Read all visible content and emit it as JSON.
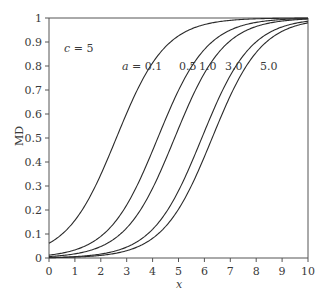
{
  "chart_data": {
    "type": "line",
    "title": "",
    "xlabel": "x",
    "ylabel": "MD",
    "xlim": [
      0,
      10
    ],
    "ylim": [
      0,
      1
    ],
    "grid": false,
    "legend": "none (inline curve labels)",
    "x_ticks": [
      "0",
      "1",
      "2",
      "3",
      "4",
      "5",
      "6",
      "7",
      "8",
      "9",
      "10"
    ],
    "y_ticks": [
      "0",
      "0.1",
      "0.2",
      "0.3",
      "0.4",
      "0.5",
      "0.6",
      "0.7",
      "0.8",
      "0.9",
      "1"
    ],
    "annotations": [
      {
        "text": "c = 5",
        "x": 0.55,
        "y": 0.9
      },
      {
        "text": "a = 0.1",
        "x": 2.85,
        "y": 0.8
      },
      {
        "text": "0.5",
        "x": 4.85,
        "y": 0.8
      },
      {
        "text": "1.0",
        "x": 5.5,
        "y": 0.8
      },
      {
        "text": "3.0",
        "x": 6.6,
        "y": 0.8
      },
      {
        "text": "5.0",
        "x": 8.0,
        "y": 0.8
      }
    ],
    "x": [
      0,
      1,
      2,
      3,
      4,
      5,
      6,
      7,
      8,
      9,
      10
    ],
    "series": [
      {
        "name": "a = 0.1",
        "values": [
          0.061,
          0.157,
          0.347,
          0.604,
          0.813,
          0.925,
          0.973,
          0.99,
          0.997,
          0.999,
          1.0
        ]
      },
      {
        "name": "a = 0.5",
        "values": [
          0.012,
          0.034,
          0.09,
          0.221,
          0.448,
          0.698,
          0.869,
          0.95,
          0.982,
          0.994,
          0.998
        ]
      },
      {
        "name": "a = 1.0",
        "values": [
          0.006,
          0.017,
          0.048,
          0.125,
          0.291,
          0.539,
          0.77,
          0.905,
          0.965,
          0.988,
          0.996
        ]
      },
      {
        "name": "a = 3.0",
        "values": [
          0.002,
          0.006,
          0.016,
          0.045,
          0.12,
          0.28,
          0.526,
          0.761,
          0.901,
          0.963,
          0.987
        ]
      },
      {
        "name": "a = 5.0",
        "values": [
          0.001,
          0.004,
          0.011,
          0.03,
          0.082,
          0.204,
          0.422,
          0.675,
          0.857,
          0.944,
          0.98
        ]
      }
    ],
    "curve_model": {
      "form": "logistic",
      "k": 1.05,
      "midpoints": {
        "a = 0.1": 2.6,
        "a = 0.5": 4.2,
        "a = 1.0": 4.85,
        "a = 3.0": 5.9,
        "a = 5.0": 6.3
      }
    }
  },
  "labels": {
    "param_c": "c = 5",
    "a_prefix": "a",
    "a_first": " = 0.1",
    "a_05": "0.5",
    "a_10": "1.0",
    "a_30": "3.0",
    "a_50": "5.0",
    "xlabel": "x",
    "ylabel": "MD"
  },
  "colors": {
    "curve": "#2b2b2b",
    "axis": "#555555",
    "text": "#3a3a3a",
    "background": "#ffffff"
  }
}
